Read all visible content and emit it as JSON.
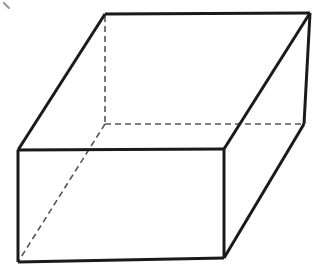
{
  "figure": {
    "kind": "line-diagram",
    "canvas": {
      "width": 319,
      "height": 268
    },
    "colors": {
      "background": "#ffffff",
      "solid_edge": "#1a1a1a",
      "hidden_edge": "#555555",
      "face_fill": "#ffffff",
      "artifact": "#9a9a9a"
    },
    "stroke": {
      "solid_width": 3,
      "hidden_width": 1.6,
      "hidden_dash": "6 4"
    },
    "vertices": {
      "front_top_left": {
        "x": 18,
        "y": 150
      },
      "front_top_right": {
        "x": 224,
        "y": 149
      },
      "front_bottom_right": {
        "x": 224,
        "y": 258
      },
      "front_bottom_left": {
        "x": 18,
        "y": 262
      },
      "back_top_left": {
        "x": 105,
        "y": 14
      },
      "back_top_right": {
        "x": 310,
        "y": 13
      },
      "back_bottom_right": {
        "x": 304,
        "y": 124
      },
      "back_bottom_left_hidden": {
        "x": 105,
        "y": 124
      }
    },
    "faces": [
      {
        "name": "top-face",
        "points": "18,150 105,14 310,13 224,149"
      },
      {
        "name": "front-face",
        "points": "18,150 224,149 224,258 18,262"
      },
      {
        "name": "right-face",
        "points": "224,149 310,13 304,124 224,258"
      }
    ],
    "solid_edges": [
      {
        "name": "top-back-edge",
        "points": "105,14 310,13"
      },
      {
        "name": "top-left-edge",
        "points": "18,150 105,14"
      },
      {
        "name": "top-right-edge",
        "points": "224,149 310,13"
      },
      {
        "name": "front-top-edge",
        "points": "18,150 224,149"
      },
      {
        "name": "front-left-edge",
        "points": "18,150 18,262"
      },
      {
        "name": "front-bottom-edge",
        "points": "18,262 224,258"
      },
      {
        "name": "front-right-edge",
        "points": "224,149 224,258"
      },
      {
        "name": "back-right-vertical-edge",
        "points": "310,13 304,124"
      },
      {
        "name": "bottom-right-receding-edge",
        "points": "304,124 224,258"
      }
    ],
    "hidden_edges": [
      {
        "name": "hidden-vertical-edge",
        "points": "105,16 105,124"
      },
      {
        "name": "hidden-back-bottom-edge",
        "points": "105,124 304,124"
      },
      {
        "name": "hidden-receding-bottom-edge",
        "points": "105,124 18,262"
      }
    ],
    "artifact": {
      "name": "scan-artifact-mark",
      "points": "4,3 9,8"
    }
  }
}
